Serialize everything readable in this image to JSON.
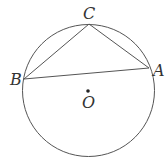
{
  "diagram": {
    "title": "",
    "circle": {
      "center_label": "O",
      "cx": 88.5,
      "cy": 90.5,
      "r": 66
    },
    "points": [
      {
        "id": "A",
        "label": "A",
        "x": 149,
        "y": 68
      },
      {
        "id": "B",
        "label": "B",
        "x": 24,
        "y": 79
      },
      {
        "id": "C",
        "label": "C",
        "x": 89,
        "y": 24
      }
    ],
    "segments": [
      {
        "from": "B",
        "to": "C"
      },
      {
        "from": "C",
        "to": "A"
      },
      {
        "from": "B",
        "to": "A"
      }
    ],
    "colors": {
      "stroke": "#555555",
      "text": "#333333",
      "background": "#ffffff"
    }
  }
}
